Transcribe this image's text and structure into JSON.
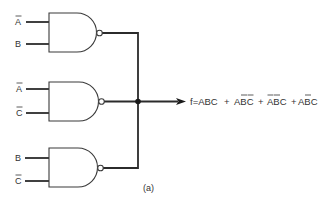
{
  "diagram": {
    "type": "logic-circuit",
    "gate_type": "NAND",
    "gates": [
      {
        "id": "gate-1",
        "inputs": [
          {
            "label": "A",
            "complemented": true
          },
          {
            "label": "B",
            "complemented": false
          }
        ]
      },
      {
        "id": "gate-2",
        "inputs": [
          {
            "label": "A",
            "complemented": true
          },
          {
            "label": "C",
            "complemented": true
          }
        ]
      },
      {
        "id": "gate-3",
        "inputs": [
          {
            "label": "B",
            "complemented": false
          },
          {
            "label": "C",
            "complemented": true
          }
        ]
      }
    ],
    "output": {
      "prefix": "f=",
      "expression": "f=ABC + AB̄C̄ + ĀB̄C + AB̄C",
      "terms": [
        {
          "text": "ABC",
          "overbars": []
        },
        {
          "text": "ABC",
          "overbars": [
            "B",
            "C"
          ]
        },
        {
          "text": "ABC",
          "overbars": [
            "A",
            "B"
          ]
        },
        {
          "text": "ABC",
          "overbars": [
            "B"
          ]
        }
      ]
    },
    "caption": "(a)"
  },
  "labels": {
    "g1_in1": "A",
    "g1_in2": "B",
    "g2_in1": "A",
    "g2_in2": "C",
    "g3_in1": "B",
    "g3_in2": "C",
    "out_prefix": "f=",
    "t1": "ABC",
    "plus": "+",
    "t2a": "A",
    "t2b": "B",
    "t2c": "C",
    "t3a": "A",
    "t3b": "B",
    "t3c": "C",
    "t4a": "A",
    "t4b": "B",
    "t4c": "C",
    "caption": "(a)"
  }
}
